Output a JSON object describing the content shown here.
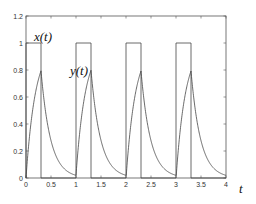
{
  "chart_data": {
    "type": "line",
    "title": "",
    "xlabel": "t",
    "ylabel": "",
    "xlim": [
      0,
      4
    ],
    "ylim": [
      0,
      1.2
    ],
    "grid": false,
    "x_ticks": [
      "0",
      "0.5",
      "1",
      "1.5",
      "2",
      "2.5",
      "3",
      "3.5",
      "4"
    ],
    "y_ticks": [
      "0",
      "0.2",
      "0.4",
      "0.6",
      "0.8",
      "1",
      "1.2"
    ],
    "annotations": [
      {
        "text": "x(t)",
        "x": 0.35,
        "y": 1.08
      },
      {
        "text": "y(t)",
        "x": 1.0,
        "y": 0.8
      }
    ],
    "series": [
      {
        "name": "x(t)",
        "description": "rectangular pulse train, period 1, width 0.3, amplitude 1",
        "x": [
          0,
          0,
          0.3,
          0.3,
          1,
          1,
          1.3,
          1.3,
          2,
          2,
          2.3,
          2.3,
          3,
          3,
          3.3,
          3.3,
          4
        ],
        "y": [
          0,
          1,
          1,
          0,
          0,
          1,
          1,
          0,
          0,
          1,
          1,
          0,
          0,
          1,
          1,
          0,
          0
        ]
      },
      {
        "name": "y(t)",
        "description": "RC response: rises to ~0.77 during each pulse, decays exponentially to ~0.02",
        "x": [
          0,
          0.3,
          0.5,
          0.7,
          1.0,
          1.3,
          1.5,
          1.7,
          2.0,
          2.3,
          2.5,
          2.7,
          3.0,
          3.3,
          3.5,
          3.7,
          4.0
        ],
        "y": [
          0.0,
          0.77,
          0.27,
          0.1,
          0.02,
          0.77,
          0.27,
          0.1,
          0.02,
          0.77,
          0.27,
          0.1,
          0.02,
          0.77,
          0.27,
          0.1,
          0.02
        ]
      }
    ]
  },
  "labels": {
    "x_signal": "x(t)",
    "y_signal": "y(t)",
    "t_axis": "t"
  },
  "plot": {
    "tau": 0.19,
    "period": 1,
    "pulse_width": 0.3,
    "line_color": "#444444",
    "frame_color": "#555555"
  }
}
